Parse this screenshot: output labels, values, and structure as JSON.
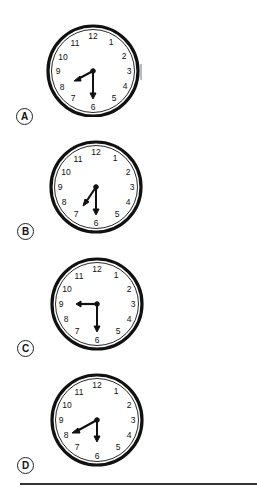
{
  "question": {
    "options": [
      {
        "letter": "A",
        "clock": {
          "numbers": [
            "12",
            "1",
            "2",
            "3",
            "4",
            "5",
            "6",
            "7",
            "8",
            "9",
            "10",
            "11"
          ],
          "hour_hand_angle_deg": 241,
          "minute_hand_angle_deg": 180,
          "center": [
            93,
            71
          ]
        }
      },
      {
        "letter": "B",
        "clock": {
          "numbers": [
            "12",
            "1",
            "2",
            "3",
            "4",
            "5",
            "6",
            "7",
            "8",
            "9",
            "10",
            "11"
          ],
          "hour_hand_angle_deg": 215,
          "minute_hand_angle_deg": 180,
          "center": [
            96,
            187
          ]
        }
      },
      {
        "letter": "C",
        "clock": {
          "numbers": [
            "12",
            "1",
            "2",
            "3",
            "4",
            "5",
            "6",
            "7",
            "8",
            "9",
            "10",
            "11"
          ],
          "hour_hand_angle_deg": 270,
          "minute_hand_angle_deg": 180,
          "center": [
            97,
            304
          ]
        }
      },
      {
        "letter": "D",
        "clock": {
          "numbers": [
            "12",
            "1",
            "2",
            "3",
            "4",
            "5",
            "6",
            "7",
            "8",
            "9",
            "10",
            "11"
          ],
          "hour_hand_angle_deg": 243,
          "minute_hand_angle_deg": 180,
          "center": [
            97,
            420
          ]
        }
      }
    ]
  }
}
